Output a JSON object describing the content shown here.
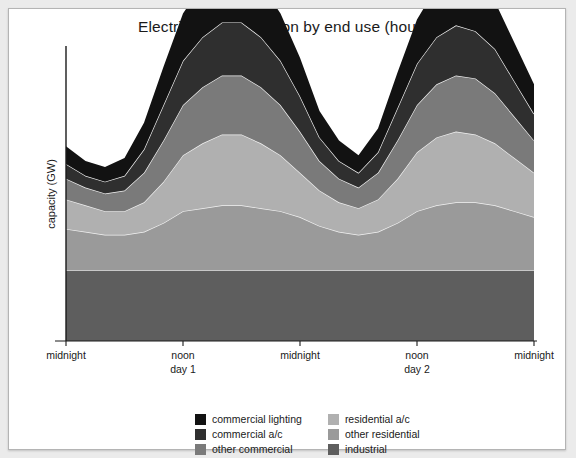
{
  "figure": {
    "title": "Electricity consumption by end use (hourly)",
    "background": "#ffffff",
    "page_background": "#ebebeb",
    "border_color": "#b4b4b4"
  },
  "axes": {
    "ylabel": "capacity (GW)",
    "xlabel": "",
    "axis_color": "#1a1a1a",
    "xticks": [
      {
        "label": "midnight",
        "sub": ""
      },
      {
        "label": "noon",
        "sub": "day 1"
      },
      {
        "label": "midnight",
        "sub": ""
      },
      {
        "label": "noon",
        "sub": "day 2"
      },
      {
        "label": "midnight",
        "sub": ""
      }
    ]
  },
  "legend": {
    "columns": [
      {
        "items": [
          {
            "label": "commercial lighting",
            "color": "#121212"
          },
          {
            "label": "commercial a/c",
            "color": "#2f2f2f"
          },
          {
            "label": "other commercial",
            "color": "#7a7a7a"
          }
        ]
      },
      {
        "items": [
          {
            "label": "residential a/c",
            "color": "#b0b0b0"
          },
          {
            "label": "other residential",
            "color": "#9a9a9a"
          },
          {
            "label": "industrial",
            "color": "#5e5e5e"
          }
        ]
      }
    ]
  },
  "chart_data": {
    "type": "area",
    "stacked": true,
    "title": "Electricity consumption by end use (hourly)",
    "xlabel": "",
    "ylabel": "capacity (GW)",
    "grid": false,
    "legend_position": "bottom",
    "xlim": [
      0,
      48
    ],
    "ylim": [
      0,
      100
    ],
    "x_tick_positions": [
      0,
      12,
      24,
      36,
      48
    ],
    "x_tick_labels": [
      "midnight",
      "noon\nday 1",
      "midnight",
      "noon\nday 2",
      "midnight"
    ],
    "x": [
      0,
      2,
      4,
      6,
      8,
      10,
      12,
      14,
      16,
      18,
      20,
      22,
      24,
      26,
      28,
      30,
      32,
      34,
      36,
      38,
      40,
      42,
      44,
      46,
      48
    ],
    "series": [
      {
        "name": "industrial",
        "color": "#5e5e5e",
        "values": [
          24,
          24,
          24,
          24,
          24,
          24,
          24,
          24,
          24,
          24,
          24,
          24,
          24,
          24,
          24,
          24,
          24,
          24,
          24,
          24,
          24,
          24,
          24,
          24,
          24
        ]
      },
      {
        "name": "other residential",
        "color": "#9a9a9a",
        "values": [
          14,
          13,
          12,
          12,
          13,
          16,
          20,
          21,
          22,
          22,
          21,
          20,
          18,
          15,
          13,
          12,
          13,
          16,
          20,
          22,
          23,
          23,
          22,
          20,
          18
        ]
      },
      {
        "name": "residential a/c",
        "color": "#b0b0b0",
        "values": [
          10,
          9,
          8,
          8,
          10,
          14,
          19,
          22,
          24,
          24,
          22,
          19,
          15,
          12,
          10,
          9,
          11,
          15,
          20,
          23,
          24,
          23,
          21,
          18,
          15
        ]
      },
      {
        "name": "other commercial",
        "color": "#7a7a7a",
        "values": [
          7,
          6,
          6,
          7,
          10,
          14,
          17,
          19,
          20,
          20,
          19,
          17,
          14,
          10,
          8,
          7,
          9,
          13,
          16,
          18,
          19,
          19,
          17,
          14,
          11
        ]
      },
      {
        "name": "commercial a/c",
        "color": "#2f2f2f",
        "values": [
          5,
          4,
          4,
          5,
          8,
          12,
          15,
          17,
          18,
          18,
          17,
          15,
          12,
          8,
          6,
          5,
          7,
          11,
          14,
          16,
          17,
          16,
          15,
          12,
          9
        ]
      },
      {
        "name": "commercial lighting",
        "color": "#121212",
        "values": [
          6,
          5,
          5,
          6,
          9,
          13,
          16,
          18,
          19,
          19,
          18,
          16,
          13,
          9,
          7,
          6,
          8,
          12,
          15,
          17,
          18,
          17,
          16,
          13,
          10
        ]
      }
    ]
  }
}
